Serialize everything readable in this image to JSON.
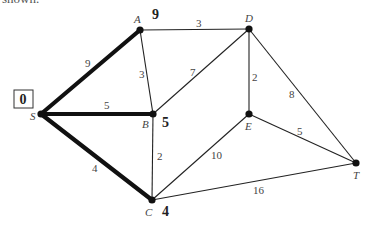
{
  "caption": "shown.",
  "nodes": [
    {
      "id": "S",
      "x": 41,
      "y": 114,
      "label": "S",
      "lx": 30,
      "ly": 120,
      "dist": "0",
      "boxed": true,
      "dx": 23,
      "dy": 104
    },
    {
      "id": "A",
      "x": 140,
      "y": 30,
      "label": "A",
      "lx": 134,
      "ly": 23,
      "dist": "9",
      "dx": 152,
      "dy": 19
    },
    {
      "id": "B",
      "x": 153,
      "y": 114,
      "label": "B",
      "lx": 142,
      "ly": 128,
      "dist": "5",
      "dx": 162,
      "dy": 127
    },
    {
      "id": "C",
      "x": 152,
      "y": 200,
      "label": "C",
      "lx": 145,
      "ly": 216,
      "dist": "4",
      "dx": 162,
      "dy": 216
    },
    {
      "id": "D",
      "x": 249,
      "y": 29,
      "label": "D",
      "lx": 245,
      "ly": 22
    },
    {
      "id": "E",
      "x": 249,
      "y": 114,
      "label": "E",
      "lx": 245,
      "ly": 130
    },
    {
      "id": "T",
      "x": 356,
      "y": 163,
      "label": "T",
      "lx": 353,
      "ly": 179
    }
  ],
  "edges": [
    {
      "from": "S",
      "to": "A",
      "weight": "9",
      "bold": true,
      "lx": 85,
      "ly": 67
    },
    {
      "from": "S",
      "to": "B",
      "weight": "5",
      "bold": true,
      "lx": 104,
      "ly": 109
    },
    {
      "from": "S",
      "to": "C",
      "weight": "4",
      "bold": true,
      "lx": 92,
      "ly": 172
    },
    {
      "from": "A",
      "to": "B",
      "weight": "3",
      "bold": false,
      "lx": 139,
      "ly": 78
    },
    {
      "from": "A",
      "to": "D",
      "weight": "3",
      "bold": false,
      "lx": 196,
      "ly": 27
    },
    {
      "from": "B",
      "to": "D",
      "weight": "7",
      "bold": false,
      "lx": 190,
      "ly": 76
    },
    {
      "from": "B",
      "to": "C",
      "weight": "2",
      "bold": false,
      "lx": 157,
      "ly": 160
    },
    {
      "from": "D",
      "to": "E",
      "weight": "2",
      "bold": false,
      "lx": 252,
      "ly": 81
    },
    {
      "from": "D",
      "to": "T",
      "weight": "8",
      "bold": false,
      "lx": 289,
      "ly": 98
    },
    {
      "from": "C",
      "to": "E",
      "weight": "10",
      "bold": false,
      "lx": 211,
      "ly": 159
    },
    {
      "from": "E",
      "to": "T",
      "weight": "5",
      "bold": false,
      "lx": 297,
      "ly": 135
    },
    {
      "from": "C",
      "to": "T",
      "weight": "16",
      "bold": false,
      "lx": 253,
      "ly": 194
    }
  ]
}
